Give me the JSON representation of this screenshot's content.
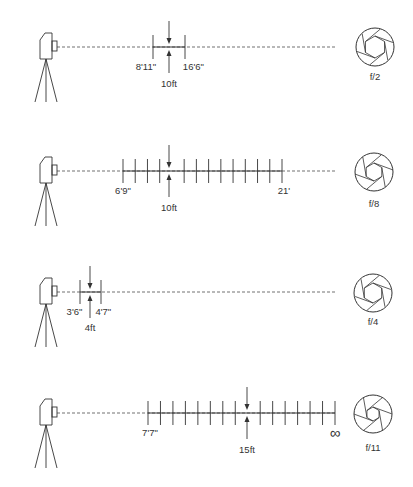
{
  "diagram": {
    "title": "",
    "type": "depth-of-field illustration",
    "colors": {
      "line": "#333333",
      "text": "#333333",
      "background": "#ffffff"
    },
    "rows": [
      {
        "id": "row-f2",
        "line_y": 47,
        "camera_x": 40,
        "focus_distance": "10ft",
        "focus_x": 169,
        "near_limit": "8'11\"",
        "far_limit": "16'6\"",
        "near_x": 153,
        "far_x": 185,
        "tick_count": 2,
        "aperture": "f/2",
        "aperture_opening": "wide",
        "dashed_end_x": 335
      },
      {
        "id": "row-f8",
        "line_y": 171,
        "camera_x": 40,
        "focus_distance": "10ft",
        "focus_x": 169,
        "near_limit": "6'9\"",
        "far_limit": "21'",
        "near_x": 123,
        "far_x": 282,
        "tick_count": 14,
        "aperture": "f/8",
        "aperture_opening": "medium",
        "dashed_end_x": 335
      },
      {
        "id": "row-f4",
        "line_y": 292,
        "camera_x": 40,
        "focus_distance": "4ft",
        "focus_x": 90,
        "near_limit": "3'6\"",
        "far_limit": "4'7\"",
        "near_x": 80,
        "far_x": 101,
        "tick_count": 2,
        "aperture": "f/4",
        "aperture_opening": "wide-medium",
        "dashed_end_x": 335
      },
      {
        "id": "row-f11",
        "line_y": 413,
        "camera_x": 40,
        "focus_distance": "15ft",
        "focus_x": 247,
        "near_limit": "7'7\"",
        "far_limit": "∞",
        "near_x": 148,
        "far_x": 335,
        "tick_count": 16,
        "aperture": "f/11",
        "aperture_opening": "narrow",
        "dashed_end_x": 335
      }
    ]
  }
}
